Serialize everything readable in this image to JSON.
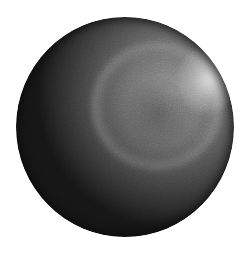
{
  "image": {
    "subject": "shaded-sphere",
    "colors": {
      "background": "#ffffff",
      "sphere_dark": "#151515",
      "sphere_mid": "#6a6a6a",
      "ring_highlight": "#dcdcdc",
      "specular": "#ebebeb"
    }
  }
}
